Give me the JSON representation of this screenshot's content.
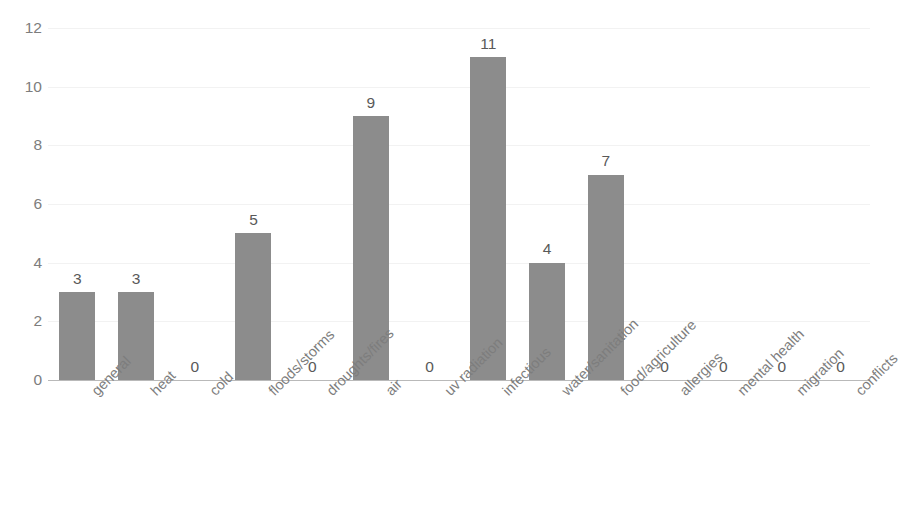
{
  "chart_data": {
    "type": "bar",
    "title": "",
    "subtitle": "",
    "xlabel": "",
    "ylabel": "",
    "categories": [
      "general",
      "heat",
      "cold",
      "floods/storms",
      "droughts/fires",
      "air",
      "uv radiation",
      "infectious",
      "water/sanitation",
      "food/agriculture",
      "allergies",
      "mental health",
      "migration",
      "conflicts"
    ],
    "values": [
      3,
      3,
      0,
      5,
      0,
      9,
      0,
      11,
      4,
      7,
      0,
      0,
      0,
      0
    ],
    "data_labels": [
      "3",
      "3",
      "0",
      "5",
      "0",
      "9",
      "0",
      "11",
      "4",
      "7",
      "0",
      "0",
      "0",
      "0"
    ],
    "ylim": [
      0,
      12
    ],
    "y_ticks": [
      0,
      2,
      4,
      6,
      8,
      10,
      12
    ],
    "y_tick_labels": [
      "0",
      "2",
      "4",
      "6",
      "8",
      "10",
      "12"
    ],
    "grid": true,
    "grid_axis": "y",
    "legend": false,
    "legend_position": "none",
    "bar_color": "#8c8c8c",
    "axis_color": "#b9b9b9",
    "tick_label_color": "#7d7d7d",
    "data_label_color": "#595959",
    "gridline_color": "#f2f2f2",
    "background_color": "#ffffff",
    "x_label_rotation": -45,
    "bar_width_px": 36,
    "show_zero_labels": true
  }
}
